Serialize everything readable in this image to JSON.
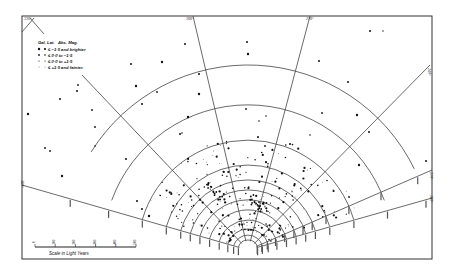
{
  "figure": {
    "longitude_labels": [
      {
        "text": "330°",
        "x": 26,
        "y": 20
      },
      {
        "text": "300°",
        "x": 188,
        "y": 19
      },
      {
        "text": "270°",
        "x": 308,
        "y": 19
      },
      {
        "text": "240°",
        "x": 428,
        "y": 66
      },
      {
        "text": "210°",
        "x": 430,
        "y": 176
      },
      {
        "text": "360°",
        "x": 22,
        "y": 186
      },
      {
        "text": "180°",
        "x": 430,
        "y": 199
      }
    ],
    "legend": {
      "header_left": "Gal. Lat.",
      "header_right": "Abs. Mag.",
      "rows": [
        {
          "symbol": "large-dot",
          "text": "≤ −1·5 and brighter"
        },
        {
          "symbol": "medium-dot",
          "text": "≤ 0·0 to −1·5"
        },
        {
          "symbol": "small-dot",
          "text": "≤ 0·0 to +1·5"
        },
        {
          "symbol": "tiny-dot",
          "text": "≤ +1·5 and fainter."
        }
      ]
    },
    "scale": {
      "label": "Scale in Light Years",
      "ticks": [
        "0",
        "100",
        "200",
        "300",
        "400",
        "500"
      ]
    }
  },
  "chart_data": {
    "type": "scatter",
    "title": "",
    "radial_lines_deg": [
      "360°",
      "330°",
      "300°",
      "270°",
      "240°",
      "210°",
      "180°"
    ],
    "distance_arcs_count": 11,
    "legend_entries": [
      "≤ −1·5 and brighter",
      "≤ 0·0 to −1·5",
      "≤ 0·0 to +1·5",
      "≤ +1·5 and fainter."
    ],
    "scale_light_years": [
      0,
      100,
      200,
      300,
      400,
      500
    ],
    "xlabel": "Scale in Light Years"
  }
}
